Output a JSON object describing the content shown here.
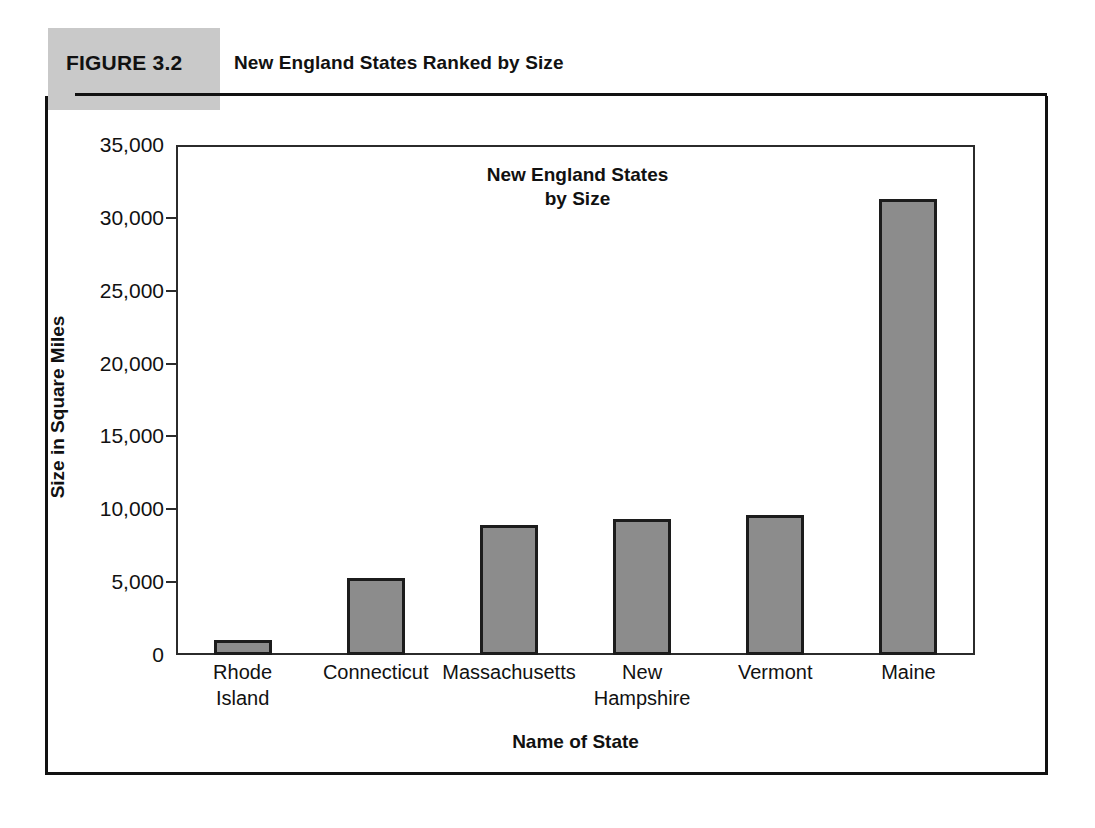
{
  "figure": {
    "number_label": "FIGURE 3.2",
    "caption": "New England States Ranked by Size"
  },
  "colors": {
    "bar_fill": "#8c8c8c",
    "bar_outline": "#1c1c1c",
    "caption_block": "#c9c9c9",
    "rule": "#111111",
    "axis": "#2b2b2b"
  },
  "chart_data": {
    "type": "bar",
    "title": "New England States\nby Size",
    "title_line1": "New England States",
    "title_line2": "by Size",
    "xlabel": "Name of State",
    "ylabel": "Size in Square Miles",
    "categories": [
      "Rhode Island",
      "Connecticut",
      "Massachusetts",
      "New Hampshire",
      "Vermont",
      "Maine"
    ],
    "category_lines": [
      [
        "Rhode",
        "Island"
      ],
      [
        "Connecticut"
      ],
      [
        "Massachusetts"
      ],
      [
        "New",
        "Hampshire"
      ],
      [
        "Vermont"
      ],
      [
        "Maine"
      ]
    ],
    "values": [
      1000,
      5280,
      8950,
      9350,
      9600,
      31300
    ],
    "ylim": [
      0,
      35000
    ],
    "yticks": [
      0,
      5000,
      10000,
      15000,
      20000,
      25000,
      30000,
      35000
    ],
    "ytick_labels": [
      "0",
      "5,000",
      "10,000",
      "15,000",
      "20,000",
      "25,000",
      "30,000",
      "35,000"
    ],
    "grid": false,
    "legend": false
  }
}
